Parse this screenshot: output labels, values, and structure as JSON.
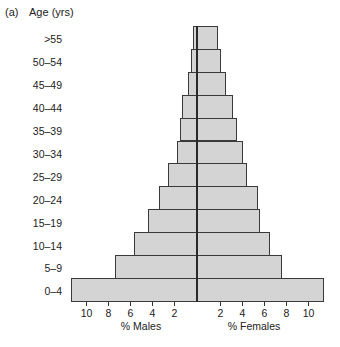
{
  "panel_label": "(a)",
  "chart_data": {
    "type": "bar",
    "orientation": "horizontal-population-pyramid",
    "title": "",
    "ylabel": "Age (yrs)",
    "xlabel_left": "% Males",
    "xlabel_right": "% Females",
    "categories": [
      ">55",
      "50–54",
      "45–49",
      "40–44",
      "35–39",
      "30–34",
      "25–29",
      "20–24",
      "15–19",
      "10–14",
      "5–9",
      "0–4"
    ],
    "series": [
      {
        "name": "% Males",
        "side": "left",
        "values": [
          0.4,
          0.55,
          0.8,
          1.4,
          1.55,
          1.8,
          2.6,
          3.5,
          4.5,
          5.7,
          7.5,
          11.5
        ]
      },
      {
        "name": "% Females",
        "side": "right",
        "values": [
          1.9,
          2.2,
          2.6,
          3.3,
          3.6,
          4.2,
          4.5,
          5.5,
          5.7,
          6.6,
          7.7,
          11.5
        ]
      }
    ],
    "xticks_left": [
      "10",
      "8",
      "6",
      "4",
      "2"
    ],
    "xticks_right": [
      "2",
      "4",
      "6",
      "8",
      "10"
    ],
    "xtick_values": [
      10,
      8,
      6,
      4,
      2
    ],
    "xlim": [
      -11.5,
      11.5
    ],
    "grid": false,
    "legend": "none",
    "colors": {
      "bar_fill": "#d4d4d4",
      "bar_border": "#3a3a3a"
    }
  }
}
